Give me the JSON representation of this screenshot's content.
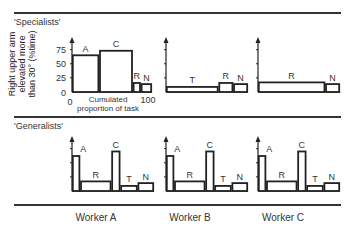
{
  "figure": {
    "sections": {
      "specialists": "'Specialists'",
      "generalists": "'Generalists'"
    },
    "ylabel": "Right upper arm\nelevated more\nthan 30° (%time)",
    "xaxis": {
      "start": "0",
      "end": "100",
      "label_line1": "Cumulated",
      "label_line2": "proportion of task"
    },
    "yticks": [
      "0",
      "25",
      "50",
      "75"
    ],
    "workers": [
      "Worker A",
      "Worker B",
      "Worker C"
    ]
  },
  "chart_data": [
    {
      "type": "bar",
      "title": "'Specialists' - Worker A",
      "xlabel": "Cumulated proportion of task",
      "ylabel": "Right upper arm elevated more than 30° (%time)",
      "ylim": [
        0,
        85
      ],
      "xlim": [
        0,
        100
      ],
      "bars": [
        {
          "task": "A",
          "x0": 0,
          "x1": 34,
          "value": 65
        },
        {
          "task": "C",
          "x0": 34,
          "x1": 76,
          "value": 73
        },
        {
          "task": "R",
          "x0": 76,
          "x1": 86,
          "value": 16
        },
        {
          "task": "N",
          "x0": 86,
          "x1": 100,
          "value": 14
        }
      ]
    },
    {
      "type": "bar",
      "title": "'Specialists' - Worker B",
      "ylim": [
        0,
        85
      ],
      "xlim": [
        0,
        100
      ],
      "bars": [
        {
          "task": "T",
          "x0": 0,
          "x1": 64,
          "value": 9
        },
        {
          "task": "R",
          "x0": 64,
          "x1": 82,
          "value": 16
        },
        {
          "task": "N",
          "x0": 82,
          "x1": 100,
          "value": 14
        }
      ]
    },
    {
      "type": "bar",
      "title": "'Specialists' - Worker C",
      "ylim": [
        0,
        85
      ],
      "xlim": [
        0,
        100
      ],
      "bars": [
        {
          "task": "R",
          "x0": 0,
          "x1": 82,
          "value": 17
        },
        {
          "task": "N",
          "x0": 82,
          "x1": 100,
          "value": 14
        }
      ]
    },
    {
      "type": "bar",
      "title": "'Generalists' - Worker A",
      "ylim": [
        0,
        85
      ],
      "xlim": [
        0,
        100
      ],
      "bars": [
        {
          "task": "A",
          "x0": 0,
          "x1": 10,
          "value": 62
        },
        {
          "task": "R",
          "x0": 10,
          "x1": 48,
          "value": 17
        },
        {
          "task": "C",
          "x0": 48,
          "x1": 59,
          "value": 70
        },
        {
          "task": "T",
          "x0": 59,
          "x1": 80,
          "value": 9
        },
        {
          "task": "N",
          "x0": 80,
          "x1": 100,
          "value": 14
        }
      ]
    },
    {
      "type": "bar",
      "title": "'Generalists' - Worker B",
      "ylim": [
        0,
        85
      ],
      "xlim": [
        0,
        100
      ],
      "bars": [
        {
          "task": "A",
          "x0": 0,
          "x1": 10,
          "value": 62
        },
        {
          "task": "R",
          "x0": 10,
          "x1": 48,
          "value": 17
        },
        {
          "task": "C",
          "x0": 48,
          "x1": 59,
          "value": 70
        },
        {
          "task": "T",
          "x0": 59,
          "x1": 80,
          "value": 9
        },
        {
          "task": "N",
          "x0": 80,
          "x1": 100,
          "value": 14
        }
      ]
    },
    {
      "type": "bar",
      "title": "'Generalists' - Worker C",
      "ylim": [
        0,
        85
      ],
      "xlim": [
        0,
        100
      ],
      "bars": [
        {
          "task": "A",
          "x0": 0,
          "x1": 10,
          "value": 62
        },
        {
          "task": "R",
          "x0": 10,
          "x1": 48,
          "value": 17
        },
        {
          "task": "C",
          "x0": 48,
          "x1": 59,
          "value": 70
        },
        {
          "task": "T",
          "x0": 59,
          "x1": 80,
          "value": 9
        },
        {
          "task": "N",
          "x0": 80,
          "x1": 100,
          "value": 14
        }
      ]
    }
  ],
  "layout": {
    "panels": [
      {
        "ox": 72,
        "oy": 92,
        "w": 80,
        "h": 48,
        "ymax": 85,
        "ticks": true
      },
      {
        "ox": 166,
        "oy": 92,
        "w": 82,
        "h": 48,
        "ymax": 85,
        "ticks": false
      },
      {
        "ox": 258,
        "oy": 92,
        "w": 82,
        "h": 48,
        "ymax": 85,
        "ticks": false
      },
      {
        "ox": 72,
        "oy": 191,
        "w": 82,
        "h": 48,
        "ymax": 85,
        "ticks": false
      },
      {
        "ox": 166,
        "oy": 191,
        "w": 82,
        "h": 48,
        "ymax": 85,
        "ticks": false
      },
      {
        "ox": 258,
        "oy": 191,
        "w": 82,
        "h": 48,
        "ymax": 85,
        "ticks": false
      }
    ]
  }
}
